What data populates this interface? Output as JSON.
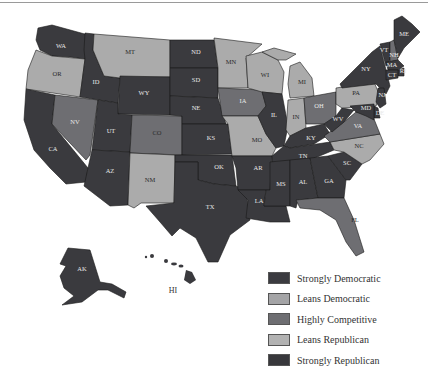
{
  "colors": {
    "strongly_democratic": "#3b3b40",
    "leans_democratic": "#a4a4a6",
    "highly_competitive": "#6e6e72",
    "leans_republican": "#b2b2b2",
    "strongly_republican": "#38383c"
  },
  "legend": {
    "items": [
      {
        "key": "strongly_democratic",
        "label": "Strongly Democratic"
      },
      {
        "key": "leans_democratic",
        "label": "Leans Democratic"
      },
      {
        "key": "highly_competitive",
        "label": "Highly Competitive"
      },
      {
        "key": "leans_republican",
        "label": "Leans Republican"
      },
      {
        "key": "strongly_republican",
        "label": "Strongly Republican"
      }
    ]
  },
  "states": {
    "WA": "WA",
    "OR": "OR",
    "CA": "CA",
    "ID": "ID",
    "NV": "NV",
    "MT": "MT",
    "WY": "WY",
    "UT": "UT",
    "AZ": "AZ",
    "CO": "CO",
    "NM": "NM",
    "ND": "ND",
    "SD": "SD",
    "NE": "NE",
    "KS": "KS",
    "OK": "OK",
    "TX": "TX",
    "MN": "MN",
    "IA": "IA",
    "MO": "MO",
    "AR": "AR",
    "LA": "LA",
    "WI": "WI",
    "IL": "IL",
    "MI": "MI",
    "IN": "IN",
    "OH": "OH",
    "KY": "KY",
    "TN": "TN",
    "MS": "MS",
    "AL": "AL",
    "GA": "GA",
    "FL": "FL",
    "SC": "SC",
    "NC": "NC",
    "VA": "VA",
    "WV": "WV",
    "PA": "PA",
    "NY": "NY",
    "VT": "VT",
    "NH": "NH",
    "ME": "ME",
    "MA": "MA",
    "CT": "CT",
    "RI": "RI",
    "NJ": "NJ",
    "DE": "DE",
    "MD": "MD",
    "AK": "AK",
    "HI": "HI"
  }
}
